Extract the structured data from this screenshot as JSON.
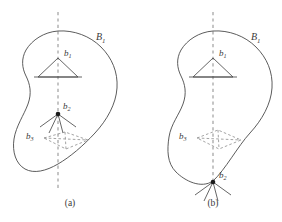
{
  "figure": {
    "title": "",
    "panels": [
      {
        "key": "a",
        "caption": "(a)",
        "region_label": "B",
        "region_sub": "1",
        "labels": {
          "b1": "b",
          "b1_sub": "1",
          "b2": "b",
          "b2_sub": "2",
          "b3": "b",
          "b3_sub": "3"
        },
        "description": "Blob region B1 with vertical dashed axis; solid triangle b1 inside upper part; point b2 on the axis interior with rays fanning downward; dashed quadrilateral b3 in lower part"
      },
      {
        "key": "b",
        "caption": "(b)",
        "region_label": "B",
        "region_sub": "1",
        "labels": {
          "b1": "b",
          "b1_sub": "1",
          "b2": "b",
          "b2_sub": "2",
          "b3": "b",
          "b3_sub": "3"
        },
        "description": "Blob region B1 with vertical dashed axis; solid triangle b1 inside upper part; point b2 located on the lower boundary with rays fanning downward outside; dashed quadrilateral b3 in lower part"
      }
    ]
  },
  "colors": {
    "outline": "#4a4a4a",
    "axis": "#b3b3b3",
    "dashed": "#8d8d8d",
    "vertex": "#1a1a1a",
    "background": "#ffffff",
    "text": "#3a3a3a"
  }
}
